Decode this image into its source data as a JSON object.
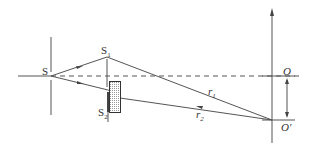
{
  "diagram": {
    "type": "young-double-slit-with-thin-slab",
    "colors": {
      "line": "#555555",
      "slab_fill": "#d8d8d8",
      "background": "#ffffff"
    },
    "labels": {
      "source": "S",
      "slit1": "S",
      "slit1_sub": "1",
      "slit2": "S",
      "slit2_sub": "2",
      "ray1": "r",
      "ray1_sub": "1",
      "ray2": "r",
      "ray2_sub": "2",
      "center": "O",
      "shifted_point": "O′"
    }
  }
}
